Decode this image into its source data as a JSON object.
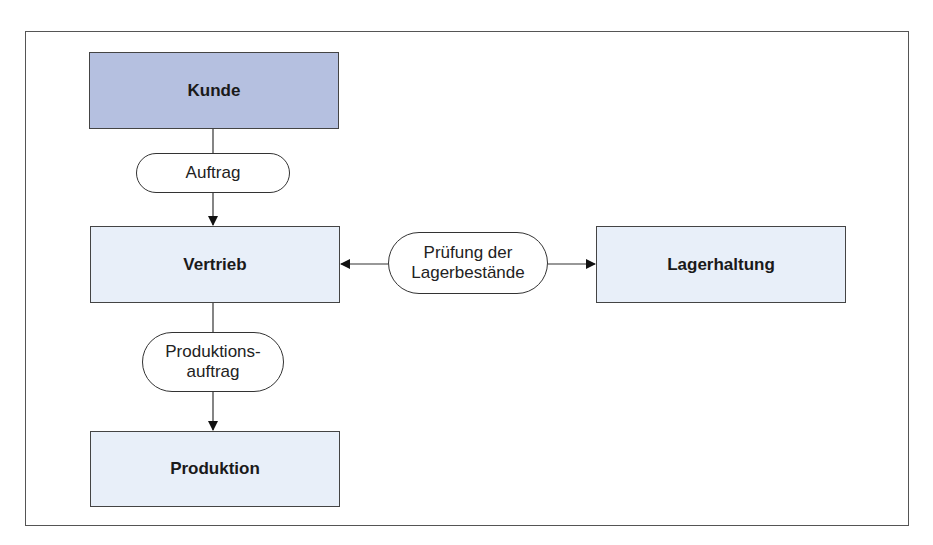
{
  "diagram": {
    "nodes": {
      "kunde": {
        "label": "Kunde",
        "fill": "#b5c0e0"
      },
      "vertrieb": {
        "label": "Vertrieb",
        "fill": "#e8eff9"
      },
      "lagerhaltung": {
        "label": "Lagerhaltung",
        "fill": "#e8eff9"
      },
      "produktion": {
        "label": "Produktion",
        "fill": "#e8eff9"
      }
    },
    "flows": {
      "auftrag": {
        "label": "Auftrag"
      },
      "pruefung": {
        "line1": "Prüfung der",
        "line2": "Lagerbestände"
      },
      "produktionsauftrag": {
        "line1": "Produktions-",
        "line2": "auftrag"
      }
    },
    "edges": [
      {
        "from": "Kunde",
        "to": "Vertrieb",
        "via": "Auftrag"
      },
      {
        "from": "Prüfung der Lagerbestände",
        "to": "Vertrieb"
      },
      {
        "from": "Prüfung der Lagerbestände",
        "to": "Lagerhaltung"
      },
      {
        "from": "Vertrieb",
        "to": "Produktion",
        "via": "Produktionsauftrag"
      }
    ]
  }
}
